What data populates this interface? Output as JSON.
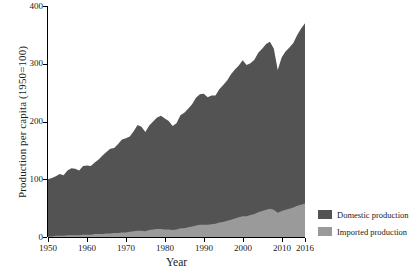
{
  "chart_data": {
    "type": "area",
    "stacked": true,
    "title": "",
    "xlabel": "Year",
    "ylabel": "Production per capita (1950=100)",
    "xlim": [
      1950,
      2016
    ],
    "ylim": [
      0,
      400
    ],
    "grid": false,
    "legend_position": "right",
    "xticks": [
      "1950",
      "1960",
      "1970",
      "1980",
      "1990",
      "2000",
      "2010",
      "2016"
    ],
    "xtick_values": [
      1950,
      1960,
      1970,
      1980,
      1990,
      2000,
      2010,
      2016
    ],
    "yticks": [
      "0",
      "100",
      "200",
      "300",
      "400"
    ],
    "ytick_values": [
      0,
      100,
      200,
      300,
      400
    ],
    "x": [
      1950,
      1951,
      1952,
      1953,
      1954,
      1955,
      1956,
      1957,
      1958,
      1959,
      1960,
      1961,
      1962,
      1963,
      1964,
      1965,
      1966,
      1967,
      1968,
      1969,
      1970,
      1971,
      1972,
      1973,
      1974,
      1975,
      1976,
      1977,
      1978,
      1979,
      1980,
      1981,
      1982,
      1983,
      1984,
      1985,
      1986,
      1987,
      1988,
      1989,
      1990,
      1991,
      1992,
      1993,
      1994,
      1995,
      1996,
      1997,
      1998,
      1999,
      2000,
      2001,
      2002,
      2003,
      2004,
      2005,
      2006,
      2007,
      2008,
      2009,
      2010,
      2011,
      2012,
      2013,
      2014,
      2015,
      2016
    ],
    "series": [
      {
        "name": "Domestic production",
        "color": "#535353",
        "values": [
          99,
          101,
          103,
          107,
          105,
          112,
          116,
          115,
          112,
          119,
          120,
          119,
          124,
          129,
          136,
          141,
          147,
          147,
          154,
          161,
          163,
          165,
          173,
          183,
          180,
          172,
          181,
          187,
          193,
          196,
          192,
          188,
          180,
          184,
          196,
          200,
          205,
          212,
          221,
          226,
          227,
          221,
          223,
          222,
          231,
          237,
          243,
          252,
          258,
          263,
          270,
          262,
          263,
          267,
          276,
          281,
          287,
          289,
          279,
          247,
          266,
          274,
          279,
          285,
          296,
          305,
          312
        ]
      },
      {
        "name": "Imported production",
        "color": "#9a9a9a",
        "values": [
          1,
          1,
          2,
          2,
          2,
          3,
          3,
          3,
          3,
          4,
          4,
          4,
          5,
          5,
          5,
          6,
          6,
          7,
          7,
          8,
          8,
          9,
          10,
          11,
          11,
          10,
          12,
          13,
          14,
          14,
          13,
          13,
          12,
          13,
          15,
          15,
          17,
          18,
          20,
          21,
          21,
          21,
          22,
          23,
          25,
          26,
          28,
          30,
          32,
          34,
          36,
          36,
          38,
          40,
          43,
          45,
          47,
          49,
          47,
          42,
          45,
          47,
          49,
          51,
          54,
          56,
          58
        ]
      }
    ],
    "totals": [
      100,
      102,
      105,
      109,
      107,
      115,
      119,
      118,
      115,
      123,
      124,
      123,
      129,
      134,
      141,
      147,
      153,
      154,
      161,
      169,
      171,
      174,
      183,
      194,
      191,
      182,
      193,
      200,
      207,
      210,
      205,
      201,
      192,
      197,
      211,
      215,
      222,
      230,
      241,
      247,
      248,
      242,
      245,
      245,
      256,
      263,
      271,
      282,
      290,
      297,
      306,
      298,
      301,
      307,
      319,
      326,
      334,
      338,
      326,
      289,
      311,
      321,
      328,
      336,
      350,
      361,
      370
    ]
  },
  "legend": {
    "items": [
      {
        "label": "Domestic production",
        "color": "#535353"
      },
      {
        "label": "Imported production",
        "color": "#9a9a9a"
      }
    ]
  }
}
